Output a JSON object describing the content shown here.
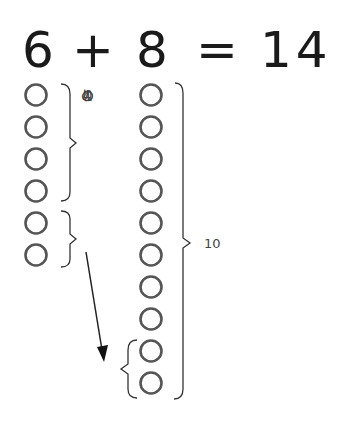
{
  "equation": {
    "left": "6",
    "op": "+",
    "right": "8",
    "eq": "=",
    "result": "14"
  },
  "left_group": {
    "count": 6,
    "remaining_label_chars": [
      "の",
      "こ",
      "り",
      "の",
      "4"
    ],
    "remaining_label": "のこりの4"
  },
  "right_group": {
    "count": 10,
    "ten_label": "10"
  },
  "colors": {
    "circle_stroke": "#555555",
    "bracket": "#333333",
    "text": "#1a1a1a"
  }
}
